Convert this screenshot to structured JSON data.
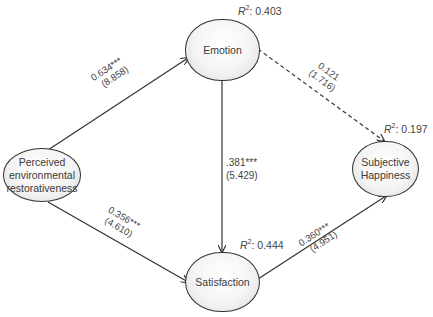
{
  "nodes": {
    "perceived": {
      "label": "Perceived environmental restorativeness",
      "lines": [
        "Perceived",
        "environmental",
        "restorativeness"
      ]
    },
    "emotion": {
      "label": "Emotion",
      "r2_prefix": "R",
      "r2_sup": "2",
      "r2_value": ": 0.403"
    },
    "satisfaction": {
      "label": "Satisfaction",
      "r2_prefix": "R",
      "r2_sup": "2",
      "r2_value": ": 0.444"
    },
    "happiness": {
      "lines": [
        "Subjective",
        "Happiness"
      ],
      "r2_prefix": "R",
      "r2_sup": "2",
      "r2_value": ": 0.197"
    }
  },
  "paths": {
    "perceived_emotion": {
      "coef": "0.634***",
      "t": "(8.858)",
      "style": "solid"
    },
    "perceived_satisfaction": {
      "coef": "0.356***",
      "t": "(4.610)",
      "style": "solid"
    },
    "emotion_satisfaction": {
      "coef": ".381***",
      "t": "(5.429)",
      "style": "solid"
    },
    "emotion_happiness": {
      "coef": "0.121",
      "t": "(1.716)",
      "style": "dashed"
    },
    "satisfaction_happiness": {
      "coef": "0.360***",
      "t": "(4.951)",
      "style": "solid"
    }
  }
}
